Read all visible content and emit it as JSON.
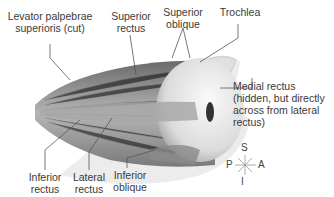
{
  "figure": {
    "labels": [
      {
        "id": "levator",
        "lines": [
          "Levator palpebrae",
          "superioris (cut)"
        ]
      },
      {
        "id": "superior-rectus",
        "lines": [
          "Superior",
          "rectus"
        ]
      },
      {
        "id": "superior-oblique",
        "lines": [
          "Superior",
          "oblique"
        ]
      },
      {
        "id": "trochlea",
        "lines": [
          "Trochlea"
        ]
      },
      {
        "id": "medial-rectus",
        "lines": [
          "Medial rectus",
          "(hidden, but directly",
          "across from lateral",
          "rectus)"
        ]
      },
      {
        "id": "inferior-rectus",
        "lines": [
          "Inferior",
          "rectus"
        ]
      },
      {
        "id": "lateral-rectus",
        "lines": [
          "Lateral",
          "rectus"
        ]
      },
      {
        "id": "inferior-oblique",
        "lines": [
          "Inferior",
          "oblique"
        ]
      }
    ],
    "compass": {
      "superior": "S",
      "inferior": "I",
      "posterior": "P",
      "anterior": "A"
    },
    "colors": {
      "muscle": "#9a9a9a",
      "muscle_dark": "#5e5e5e",
      "eyeball": "#e8e8e8",
      "bone": "#d6d6d6",
      "leader_line": "#555555"
    }
  }
}
